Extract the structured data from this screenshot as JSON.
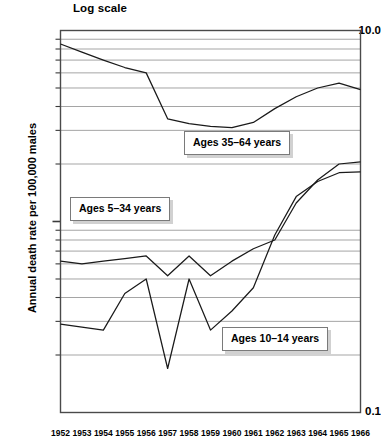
{
  "chart": {
    "title": "Log scale",
    "ylabel": "Annual death rate per 100,000 males",
    "ytick_top": "10.0",
    "ytick_bottom": "0.1"
  },
  "series_labels": {
    "s3564": "Ages 35–64 years",
    "s534": "Ages 5–34 years",
    "s1014": "Ages 10–14 years"
  },
  "chart_data": {
    "type": "line",
    "title": "Log scale",
    "xlabel": "",
    "ylabel": "Annual death rate per 100,000 males",
    "yscale": "log",
    "ylim": [
      0.1,
      10.0
    ],
    "grid": true,
    "legend_position": "inline-boxes",
    "categories": [
      1952,
      1953,
      1954,
      1955,
      1956,
      1957,
      1958,
      1959,
      1960,
      1961,
      1962,
      1963,
      1964,
      1965,
      1966
    ],
    "xtick_labels": [
      "1952",
      "1953",
      "1954",
      "1955",
      "1956",
      "1957",
      "1958",
      "1959",
      "1960",
      "1961",
      "1962",
      "1963",
      "1964",
      "1965",
      "1966"
    ],
    "ytick_labels": [
      "10.0",
      "0.1"
    ],
    "ygridlines": [
      9,
      8,
      7,
      6,
      5,
      4,
      3,
      2,
      0.9,
      0.8,
      0.7,
      0.6,
      0.5,
      0.4,
      0.3,
      0.2
    ],
    "series": [
      {
        "name": "Ages 35–64 years",
        "values": [
          8.5,
          7.7,
          7.0,
          6.4,
          6.0,
          3.45,
          3.25,
          3.15,
          3.1,
          3.3,
          3.9,
          4.5,
          5.0,
          5.3,
          4.9
        ]
      },
      {
        "name": "Ages 5–34 years",
        "values": [
          0.62,
          0.6,
          0.62,
          0.64,
          0.66,
          0.52,
          0.66,
          0.52,
          0.62,
          0.72,
          0.8,
          1.25,
          1.65,
          2.0,
          2.05
        ]
      },
      {
        "name": "Ages 10–14 years",
        "values": [
          0.29,
          0.28,
          0.27,
          0.42,
          0.5,
          0.17,
          0.5,
          0.27,
          0.34,
          0.45,
          0.85,
          1.35,
          1.62,
          1.8,
          1.82
        ]
      }
    ]
  }
}
